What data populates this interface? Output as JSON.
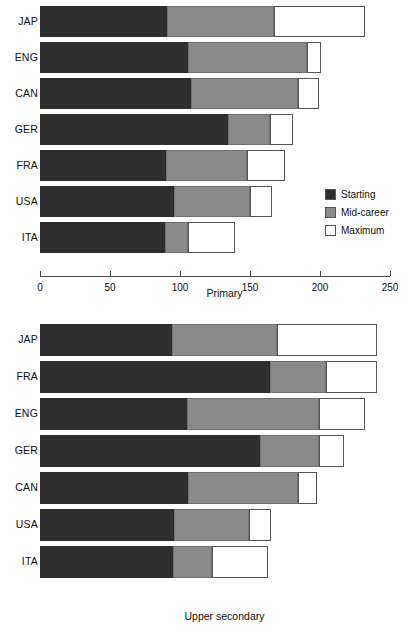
{
  "colors": {
    "starting": "#2e2e2e",
    "mid_career": "#8a8a8a",
    "maximum": "#ffffff",
    "axis": "#4a4a4a"
  },
  "legend": {
    "position": "inside-right-middle-of-top-panel",
    "items": [
      {
        "key": "starting",
        "label": "Starting"
      },
      {
        "key": "mid_career",
        "label": "Mid-career"
      },
      {
        "key": "maximum",
        "label": "Maximum"
      }
    ]
  },
  "axis": {
    "ticks": [
      "0",
      "50",
      "100",
      "150",
      "200",
      "250"
    ],
    "min": 0,
    "max": 250
  },
  "chart_data": [
    {
      "type": "bar",
      "orientation": "horizontal",
      "stacked": true,
      "title": "",
      "xlabel": "Primary",
      "ylabel": "",
      "xlim": [
        0,
        250
      ],
      "grid": false,
      "legend": [
        "Starting",
        "Mid-career",
        "Maximum"
      ],
      "categories": [
        "JAP",
        "ENG",
        "CAN",
        "GER",
        "FRA",
        "USA",
        "ITA"
      ],
      "series": [
        {
          "name": "Starting",
          "values": [
            91,
            106,
            108,
            134,
            90,
            96,
            89
          ]
        },
        {
          "name": "Mid-career",
          "values": [
            167,
            191,
            184,
            164,
            148,
            150,
            106
          ]
        },
        {
          "name": "Maximum",
          "values": [
            232,
            201,
            199,
            181,
            175,
            166,
            139
          ]
        }
      ],
      "note": "series values are cumulative stack end-points on the x axis"
    },
    {
      "type": "bar",
      "orientation": "horizontal",
      "stacked": true,
      "title": "",
      "xlabel": "Upper secondary",
      "ylabel": "",
      "xlim": [
        0,
        250
      ],
      "grid": false,
      "legend": [
        "Starting",
        "Mid-career",
        "Maximum"
      ],
      "categories": [
        "JAP",
        "FRA",
        "ENG",
        "GER",
        "CAN",
        "USA",
        "ITA"
      ],
      "series": [
        {
          "name": "Starting",
          "values": [
            94,
            164,
            105,
            157,
            106,
            96,
            95
          ]
        },
        {
          "name": "Mid-career",
          "values": [
            169,
            204,
            199,
            199,
            184,
            149,
            123
          ]
        },
        {
          "name": "Maximum",
          "values": [
            241,
            241,
            232,
            217,
            198,
            165,
            163
          ]
        }
      ],
      "note": "series values are cumulative stack end-points on the x axis"
    }
  ]
}
